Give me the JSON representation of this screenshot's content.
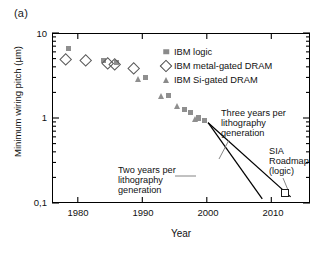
{
  "panel": {
    "label": "(a)"
  },
  "chart_data": {
    "type": "scatter",
    "title": "",
    "xlabel": "Year",
    "ylabel": "Minimum wiring pitch (µm)",
    "xlim": [
      1976,
      2016
    ],
    "ylim": [
      0.1,
      10
    ],
    "yscale": "log",
    "xscale": "linear",
    "grid": false,
    "legend_position": "upper-right-inside",
    "xticks": [
      1980,
      1990,
      2000,
      2010
    ],
    "xtick_labels": [
      "1980",
      "1990",
      "2000",
      "2010"
    ],
    "yticks": [
      0.1,
      1,
      10
    ],
    "ytick_labels": [
      "0,1",
      "1",
      "10"
    ],
    "marker_color": "#8f8f8f",
    "open_marker_color": "#5a5a5a",
    "series": [
      {
        "name": "IBM logic",
        "marker": "filled-square",
        "points": [
          {
            "x": 1978.5,
            "y": 6.6
          },
          {
            "x": 1984.0,
            "y": 4.7
          },
          {
            "x": 1986.0,
            "y": 4.5
          },
          {
            "x": 1990.5,
            "y": 3.0
          },
          {
            "x": 1994.0,
            "y": 1.85
          },
          {
            "x": 1996.5,
            "y": 1.25
          },
          {
            "x": 1997.5,
            "y": 1.15
          },
          {
            "x": 1998.7,
            "y": 1.0
          },
          {
            "x": 1999.7,
            "y": 0.93
          }
        ]
      },
      {
        "name": "IBM metal-gated DRAM",
        "marker": "open-diamond",
        "points": [
          {
            "x": 1978.0,
            "y": 5.0
          },
          {
            "x": 1981.0,
            "y": 4.8
          },
          {
            "x": 1984.5,
            "y": 4.5
          },
          {
            "x": 1985.5,
            "y": 4.4
          },
          {
            "x": 1988.5,
            "y": 3.9
          }
        ]
      },
      {
        "name": "IBM Si-gated DRAM",
        "marker": "filled-triangle",
        "points": [
          {
            "x": 1989.5,
            "y": 2.85
          },
          {
            "x": 1993.0,
            "y": 1.8
          },
          {
            "x": 1995.5,
            "y": 1.35
          },
          {
            "x": 1998.3,
            "y": 0.95
          }
        ]
      },
      {
        "name": "SIA Roadmap (logic)",
        "marker": "open-square",
        "points": [
          {
            "x": 2012.0,
            "y": 0.135
          }
        ]
      }
    ],
    "trend_lines": [
      {
        "name": "Three years per lithography generation",
        "x": [
          2000.2,
          2013.0
        ],
        "y": [
          0.88,
          0.118
        ]
      },
      {
        "name": "Two years per lithography generation",
        "x": [
          2000.2,
          2008.6
        ],
        "y": [
          0.88,
          0.112
        ]
      }
    ],
    "annotations": [
      {
        "id": "three-years",
        "text_lines": [
          "Three years per",
          "lithography",
          "generation"
        ]
      },
      {
        "id": "two-years",
        "text_lines": [
          "Two years per",
          "lithography",
          "generation"
        ]
      },
      {
        "id": "sia-roadmap",
        "text_lines": [
          "SIA",
          "Roadmap",
          "(logic)"
        ]
      }
    ]
  },
  "legend": {
    "items": [
      {
        "label": "IBM logic",
        "marker": "filled-square"
      },
      {
        "label": "IBM metal-gated DRAM",
        "marker": "open-diamond"
      },
      {
        "label": "IBM Si-gated DRAM",
        "marker": "filled-triangle"
      }
    ]
  }
}
